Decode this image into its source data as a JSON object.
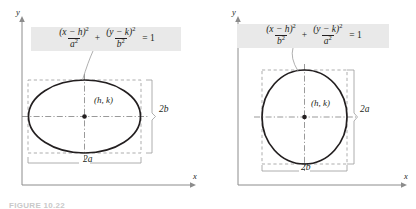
{
  "figure": {
    "caption": "FIGURE 10.22",
    "panels": [
      {
        "id": "horizontal-major-axis",
        "equation": {
          "term1": {
            "numerator": "(x − h)",
            "numerator_exponent": "2",
            "denominator": "a",
            "denominator_exponent": "2"
          },
          "operator": "+",
          "term2": {
            "numerator": "(y − k)",
            "numerator_exponent": "2",
            "denominator": "b",
            "denominator_exponent": "2"
          },
          "equals": "= 1"
        },
        "center_label": "(h, k)",
        "dimension_vertical": "2b",
        "dimension_horizontal": "2a",
        "axis_x_label": "x",
        "axis_y_label": "y"
      },
      {
        "id": "vertical-major-axis",
        "equation": {
          "term1": {
            "numerator": "(x − h)",
            "numerator_exponent": "2",
            "denominator": "b",
            "denominator_exponent": "2"
          },
          "operator": "+",
          "term2": {
            "numerator": "(y − k)",
            "numerator_exponent": "2",
            "denominator": "a",
            "denominator_exponent": "2"
          },
          "equals": "= 1"
        },
        "center_label": "(h, k)",
        "dimension_vertical": "2a",
        "dimension_horizontal": "2b",
        "axis_x_label": "x",
        "axis_y_label": "y"
      }
    ]
  },
  "colors": {
    "ink": "#231f20",
    "equation_box_background": "#e9e9e9",
    "axis": "#8c8c8c",
    "guide": "#9a9a9a",
    "caption": "#c9c9c9"
  }
}
